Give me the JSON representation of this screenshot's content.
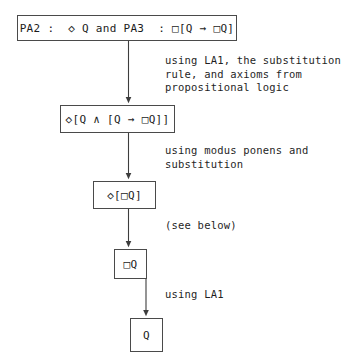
{
  "diagram": {
    "stroke_color": "#4a4a4a",
    "text_color": "#1b1b1b",
    "background_color": "#ffffff",
    "nodes": [
      {
        "id": "premises",
        "label": "PA2 :  ◇ Q and PA3  : □[Q → □Q]"
      },
      {
        "id": "conjunction",
        "label": "◇[Q ∧ [Q → □Q]]"
      },
      {
        "id": "diamondbox",
        "label": "◇[□Q]"
      },
      {
        "id": "boxq",
        "label": "□Q"
      },
      {
        "id": "q",
        "label": "Q"
      }
    ],
    "edges": [
      {
        "id": "edge-1",
        "from": "premises",
        "to": "conjunction",
        "annotation": "using LA1, the substitution\nrule, and axioms from\npropositional logic"
      },
      {
        "id": "edge-2",
        "from": "conjunction",
        "to": "diamondbox",
        "annotation": "using modus ponens and\nsubstitution"
      },
      {
        "id": "edge-3",
        "from": "diamondbox",
        "to": "boxq",
        "annotation": "(see below)"
      },
      {
        "id": "edge-4",
        "from": "boxq",
        "to": "q",
        "annotation": "using LA1"
      }
    ]
  }
}
